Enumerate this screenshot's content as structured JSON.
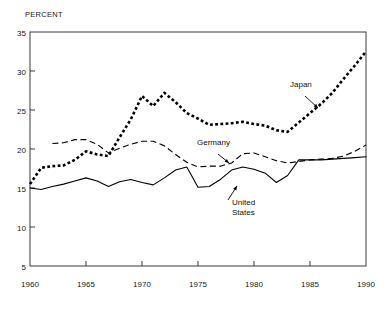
{
  "chart_data": {
    "type": "line",
    "title": "",
    "subtitle": "",
    "xlabel": "",
    "ylabel": "PERCENT",
    "ylabel_position": "top-left",
    "xlim": [
      1960,
      1990
    ],
    "ylim": [
      5,
      35
    ],
    "yticks": [
      5,
      10,
      15,
      20,
      25,
      30,
      35
    ],
    "xticks": [
      1960,
      1965,
      1970,
      1975,
      1980,
      1985,
      1990
    ],
    "grid": false,
    "legend": "inline-annotations",
    "x": [
      1960,
      1961,
      1962,
      1963,
      1964,
      1965,
      1966,
      1967,
      1968,
      1969,
      1970,
      1971,
      1972,
      1973,
      1974,
      1975,
      1976,
      1977,
      1978,
      1979,
      1980,
      1981,
      1982,
      1983,
      1984,
      1985,
      1986,
      1987,
      1988,
      1989,
      1990
    ],
    "series": [
      {
        "name": "Japan",
        "style": "thick-dotted",
        "color": "#000000",
        "values": [
          15.5,
          17.6,
          17.8,
          17.9,
          18.6,
          19.7,
          19.3,
          19.1,
          21.5,
          23.8,
          26.8,
          25.5,
          27.2,
          26.0,
          24.6,
          23.9,
          23.1,
          23.2,
          23.3,
          23.5,
          23.2,
          23.0,
          22.4,
          22.2,
          23.4,
          24.6,
          25.8,
          27.2,
          29.0,
          30.7,
          32.5
        ]
      },
      {
        "name": "Germany",
        "style": "dashed",
        "color": "#000000",
        "values": [
          null,
          null,
          20.7,
          20.8,
          21.2,
          21.2,
          20.6,
          19.5,
          20.1,
          20.6,
          21.0,
          21.0,
          20.4,
          19.3,
          18.3,
          17.7,
          17.8,
          17.8,
          18.2,
          19.4,
          19.5,
          19.0,
          18.5,
          18.2,
          18.4,
          18.6,
          18.7,
          18.8,
          19.1,
          19.7,
          20.5
        ]
      },
      {
        "name": "United States",
        "style": "solid",
        "color": "#000000",
        "values": [
          15.0,
          14.8,
          15.2,
          15.5,
          15.9,
          16.3,
          15.9,
          15.2,
          15.8,
          16.1,
          15.7,
          15.4,
          16.3,
          17.3,
          17.7,
          15.1,
          15.2,
          16.1,
          17.3,
          17.7,
          17.4,
          16.9,
          15.7,
          16.6,
          18.6,
          18.6,
          18.6,
          18.7,
          18.8,
          18.9,
          19.0
        ]
      }
    ],
    "annotations": [
      {
        "name": "japan-annotation",
        "label": "Japan",
        "label_x_px": 290,
        "label_y_px": 86,
        "arrow_from_x_px": 305,
        "arrow_from_y_px": 96,
        "arrow_to_x_px": 318,
        "arrow_to_y_px": 108
      },
      {
        "name": "germany-annotation",
        "label": "Germany",
        "label_x_px": 197,
        "label_y_px": 144,
        "arrow_from_x_px": 218,
        "arrow_from_y_px": 154,
        "arrow_to_x_px": 229,
        "arrow_to_y_px": 163
      },
      {
        "name": "united-states-annotation",
        "label_line1": "United",
        "label_line2": "States",
        "label_x_px": 232,
        "label_y_px": 202,
        "arrow_from_x_px": 228,
        "arrow_from_y_px": 200,
        "arrow_to_x_px": 237,
        "arrow_to_y_px": 186
      }
    ]
  }
}
